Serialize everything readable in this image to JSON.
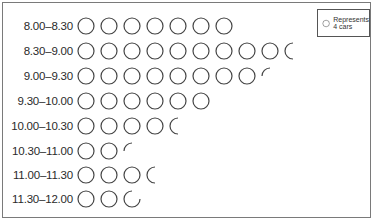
{
  "legend": {
    "icon": "circle-icon",
    "line1": "Represents",
    "line2": "4 cars",
    "cars_per_symbol": 4
  },
  "chart_data": {
    "type": "pictogram",
    "title": "",
    "xlabel": "",
    "ylabel": "Time",
    "unit": "cars",
    "symbol_value": 4,
    "categories": [
      "8.00–8.30",
      "8.30–9.00",
      "9.00–9.30",
      "9.30–10.00",
      "10.00–10.30",
      "10.30–11.00",
      "11.00–11.30",
      "11.30–12.00"
    ],
    "symbols": [
      7,
      9.5,
      8.25,
      6,
      4.5,
      2.25,
      3.5,
      2.75
    ],
    "values": [
      28,
      38,
      33,
      24,
      18,
      9,
      14,
      11
    ],
    "legend_position": "top-right"
  },
  "rows": [
    {
      "label": "8.00–8.30",
      "full": 7,
      "partial": 0
    },
    {
      "label": "8.30–9.00",
      "full": 9,
      "partial": 0.5
    },
    {
      "label": "9.00–9.30",
      "full": 8,
      "partial": 0.25
    },
    {
      "label": "9.30–10.00",
      "full": 6,
      "partial": 0
    },
    {
      "label": "10.00–10.30",
      "full": 4,
      "partial": 0.5
    },
    {
      "label": "10.30–11.00",
      "full": 2,
      "partial": 0.25
    },
    {
      "label": "11.00–11.30",
      "full": 3,
      "partial": 0.5
    },
    {
      "label": "11.30–12.00",
      "full": 2,
      "partial": 0.75
    }
  ]
}
